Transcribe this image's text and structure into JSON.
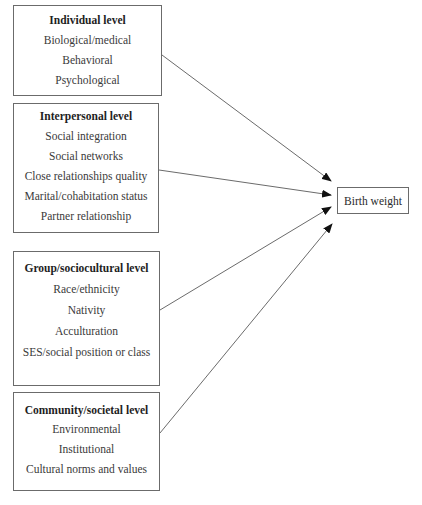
{
  "diagram": {
    "type": "multilevel-influence-diagram",
    "outcome": {
      "label": "Birth weight"
    },
    "levels": [
      {
        "title": "Individual level",
        "items": [
          "Biological/medical",
          "Behavioral",
          "Psychological"
        ]
      },
      {
        "title": "Interpersonal level",
        "items": [
          "Social integration",
          "Social networks",
          "Close relationships quality",
          "Marital/cohabitation status",
          "Partner relationship"
        ]
      },
      {
        "title": "Group/sociocultural level",
        "items": [
          "Race/ethnicity",
          "Nativity",
          "Acculturation",
          "SES/social position or class"
        ]
      },
      {
        "title": "Community/societal level",
        "items": [
          "Environmental",
          "Institutional",
          "Cultural norms and values"
        ]
      }
    ],
    "arrows": [
      {
        "from": "Individual level",
        "to": "Birth weight"
      },
      {
        "from": "Interpersonal level",
        "to": "Birth weight"
      },
      {
        "from": "Group/sociocultural level",
        "to": "Birth weight"
      },
      {
        "from": "Community/societal level",
        "to": "Birth weight"
      }
    ],
    "colors": {
      "line": "#6b6b6b",
      "arrowhead": "#111111",
      "text": "#2a2a2a"
    }
  }
}
